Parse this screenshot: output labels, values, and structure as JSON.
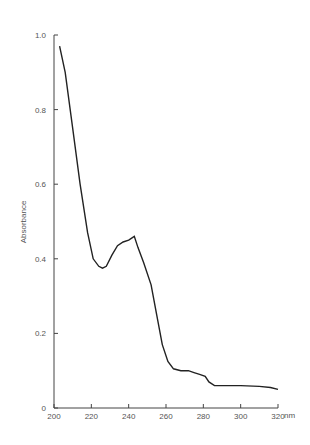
{
  "chart_data": {
    "type": "line",
    "title": "",
    "xlabel": "nm",
    "ylabel": "Absorbance",
    "xlim": [
      200,
      320
    ],
    "ylim": [
      0,
      1.0
    ],
    "xticks": [
      200,
      220,
      240,
      260,
      280,
      300,
      320
    ],
    "yticks": [
      0,
      0.2,
      0.4,
      0.6,
      0.8,
      1.0
    ],
    "ytick_labels": [
      "0",
      "0.2",
      "0.4",
      "0.6",
      "0.8",
      "1.0"
    ],
    "grid": false,
    "series": [
      {
        "name": "spectrum",
        "x": [
          203,
          206,
          210,
          214,
          218,
          221,
          224,
          226,
          228,
          231,
          234,
          237,
          240,
          243,
          245,
          248,
          252,
          255,
          258,
          261,
          264,
          268,
          272,
          275,
          278,
          281,
          283,
          286,
          290,
          300,
          310,
          316,
          320
        ],
        "y": [
          0.97,
          0.9,
          0.75,
          0.6,
          0.47,
          0.4,
          0.38,
          0.375,
          0.38,
          0.41,
          0.435,
          0.445,
          0.45,
          0.46,
          0.43,
          0.39,
          0.33,
          0.25,
          0.17,
          0.125,
          0.105,
          0.1,
          0.1,
          0.095,
          0.09,
          0.085,
          0.07,
          0.06,
          0.06,
          0.06,
          0.058,
          0.055,
          0.05
        ]
      }
    ]
  }
}
